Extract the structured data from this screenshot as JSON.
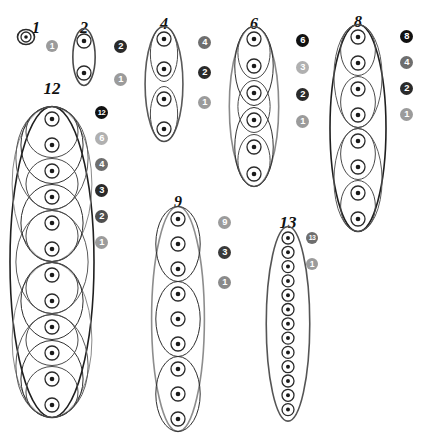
{
  "figure": {
    "kind": "divisor-grouping-diagram",
    "background": "#ffffff",
    "ink": "#222222"
  },
  "palette": {
    "level_1": "#9b9b9b",
    "level_2": "#4f4f4f",
    "level_3": "#2a2a2a",
    "level_4": "#6e6e6e",
    "level_6": "#b0b0b0",
    "level_top": "#111111",
    "ellipse_dark": "#333333",
    "ellipse_mid": "#707070",
    "ellipse_light": "#a8a8a8"
  },
  "chart_data": {
    "type": "diagram",
    "title": "",
    "panels": [
      {
        "id": "panel-1",
        "title": "1",
        "dots": 1,
        "legend": [
          "1"
        ],
        "legend_colors": [
          "#9b9b9b"
        ],
        "groupings": [
          1
        ]
      },
      {
        "id": "panel-2",
        "title": "2",
        "dots": 2,
        "legend": [
          "2",
          "1"
        ],
        "legend_colors": [
          "#2a2a2a",
          "#9b9b9b"
        ],
        "groupings": [
          2,
          1
        ]
      },
      {
        "id": "panel-4",
        "title": "4",
        "dots": 4,
        "legend": [
          "4",
          "2",
          "1"
        ],
        "legend_colors": [
          "#6e6e6e",
          "#2a2a2a",
          "#9b9b9b"
        ],
        "groupings": [
          4,
          2,
          1
        ]
      },
      {
        "id": "panel-6",
        "title": "6",
        "dots": 6,
        "legend": [
          "6",
          "3",
          "2",
          "1"
        ],
        "legend_colors": [
          "#111111",
          "#b0b0b0",
          "#2a2a2a",
          "#9b9b9b"
        ],
        "groupings": [
          6,
          3,
          2,
          1
        ]
      },
      {
        "id": "panel-8",
        "title": "8",
        "dots": 8,
        "legend": [
          "8",
          "4",
          "2",
          "1"
        ],
        "legend_colors": [
          "#111111",
          "#6e6e6e",
          "#2a2a2a",
          "#9b9b9b"
        ],
        "groupings": [
          8,
          4,
          2,
          1
        ]
      },
      {
        "id": "panel-9",
        "title": "9",
        "dots": 9,
        "legend": [
          "9",
          "3",
          "1"
        ],
        "legend_colors": [
          "#9b9b9b",
          "#3a3a3a",
          "#8a8a8a"
        ],
        "groupings": [
          9,
          3,
          1
        ]
      },
      {
        "id": "panel-12",
        "title": "12",
        "dots": 12,
        "legend": [
          "12",
          "6",
          "4",
          "3",
          "2",
          "1"
        ],
        "legend_colors": [
          "#111111",
          "#b0b0b0",
          "#6e6e6e",
          "#2a2a2a",
          "#4f4f4f",
          "#9b9b9b"
        ],
        "groupings": [
          12,
          6,
          4,
          3,
          2,
          1
        ]
      },
      {
        "id": "panel-13",
        "title": "13",
        "dots": 13,
        "legend": [
          "13",
          "1"
        ],
        "legend_colors": [
          "#6e6e6e",
          "#9b9b9b"
        ],
        "groupings": [
          13,
          1
        ]
      }
    ]
  }
}
